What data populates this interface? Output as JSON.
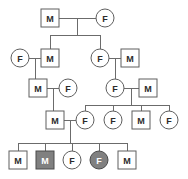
{
  "chart_data": {
    "type": "diagram",
    "title": "",
    "diagram_kind": "pedigree-chart",
    "generations": 5,
    "legend": {
      "square_means": "M",
      "circle_means": "F",
      "shaded_means": "affected",
      "unshaded_means": "unaffected"
    },
    "individuals": [
      {
        "id": "I-1",
        "generation": 1,
        "label": "M",
        "sex": "male",
        "shape": "square",
        "affected": false,
        "x": 50,
        "y": 18
      },
      {
        "id": "I-2",
        "generation": 1,
        "label": "F",
        "sex": "female",
        "shape": "circle",
        "affected": false,
        "x": 105,
        "y": 18
      },
      {
        "id": "II-1",
        "generation": 2,
        "label": "F",
        "sex": "female",
        "shape": "circle",
        "affected": false,
        "x": 20,
        "y": 58
      },
      {
        "id": "II-2",
        "generation": 2,
        "label": "M",
        "sex": "male",
        "shape": "square",
        "affected": false,
        "x": 50,
        "y": 58
      },
      {
        "id": "II-3",
        "generation": 2,
        "label": "F",
        "sex": "female",
        "shape": "circle",
        "affected": false,
        "x": 100,
        "y": 58
      },
      {
        "id": "II-4",
        "generation": 2,
        "label": "M",
        "sex": "male",
        "shape": "square",
        "affected": false,
        "x": 130,
        "y": 58
      },
      {
        "id": "III-1",
        "generation": 3,
        "label": "M",
        "sex": "male",
        "shape": "square",
        "affected": false,
        "x": 38,
        "y": 88
      },
      {
        "id": "III-2",
        "generation": 3,
        "label": "F",
        "sex": "female",
        "shape": "circle",
        "affected": false,
        "x": 68,
        "y": 88
      },
      {
        "id": "III-3",
        "generation": 3,
        "label": "F",
        "sex": "female",
        "shape": "circle",
        "affected": false,
        "x": 115,
        "y": 88
      },
      {
        "id": "III-4",
        "generation": 3,
        "label": "M",
        "sex": "male",
        "shape": "square",
        "affected": false,
        "x": 148,
        "y": 88
      },
      {
        "id": "IV-1",
        "generation": 4,
        "label": "M",
        "sex": "male",
        "shape": "square",
        "affected": false,
        "x": 55,
        "y": 120
      },
      {
        "id": "IV-2",
        "generation": 4,
        "label": "F",
        "sex": "female",
        "shape": "circle",
        "affected": false,
        "x": 85,
        "y": 120
      },
      {
        "id": "IV-3",
        "generation": 4,
        "label": "F",
        "sex": "female",
        "shape": "circle",
        "affected": false,
        "x": 113,
        "y": 120
      },
      {
        "id": "IV-4",
        "generation": 4,
        "label": "M",
        "sex": "male",
        "shape": "square",
        "affected": false,
        "x": 141,
        "y": 120
      },
      {
        "id": "IV-5",
        "generation": 4,
        "label": "F",
        "sex": "female",
        "shape": "circle",
        "affected": false,
        "x": 169,
        "y": 120
      },
      {
        "id": "V-1",
        "generation": 5,
        "label": "M",
        "sex": "male",
        "shape": "square",
        "affected": false,
        "x": 18,
        "y": 160
      },
      {
        "id": "V-2",
        "generation": 5,
        "label": "M",
        "sex": "male",
        "shape": "square",
        "affected": true,
        "x": 45,
        "y": 160
      },
      {
        "id": "V-3",
        "generation": 5,
        "label": "F",
        "sex": "female",
        "shape": "circle",
        "affected": false,
        "x": 72,
        "y": 160
      },
      {
        "id": "V-4",
        "generation": 5,
        "label": "F",
        "sex": "female",
        "shape": "circle",
        "affected": true,
        "x": 99,
        "y": 160
      },
      {
        "id": "V-5",
        "generation": 5,
        "label": "M",
        "sex": "male",
        "shape": "square",
        "affected": false,
        "x": 127,
        "y": 160
      }
    ],
    "matings": [
      {
        "partners": [
          "I-1",
          "I-2"
        ],
        "children": [
          "II-2",
          "II-3"
        ]
      },
      {
        "partners": [
          "II-1",
          "II-2"
        ],
        "children": [
          "III-1"
        ]
      },
      {
        "partners": [
          "II-3",
          "II-4"
        ],
        "children": [
          "III-3"
        ]
      },
      {
        "partners": [
          "III-1",
          "III-2"
        ],
        "children": [
          "IV-1"
        ]
      },
      {
        "partners": [
          "III-3",
          "III-4"
        ],
        "children": [
          "IV-2",
          "IV-3",
          "IV-4",
          "IV-5"
        ]
      },
      {
        "partners": [
          "IV-1",
          "IV-2"
        ],
        "children": [
          "V-1",
          "V-2",
          "V-3",
          "V-4",
          "V-5"
        ]
      }
    ],
    "affected_count": 2,
    "total_individuals": 20,
    "colors": {
      "background": "#ffffff",
      "line": "#6b6b6b",
      "symbol_stroke": "#5f5f5f",
      "unaffected_fill": "#ffffff",
      "affected_fill": "#808080",
      "unaffected_text": "#2b2b2b",
      "affected_text": "#ffffff"
    },
    "geometry": {
      "square_size": 18,
      "circle_radius": 9,
      "canvas_width": 188,
      "canvas_height": 179
    }
  },
  "connectors": [
    {
      "name": "mate-line-gen1",
      "x1": 59,
      "y1": 18,
      "x2": 96,
      "y2": 18
    },
    {
      "name": "sibdrop-gen1",
      "x1": 77,
      "y1": 18,
      "x2": 77,
      "y2": 35
    },
    {
      "name": "sibline-gen1",
      "x1": 50,
      "y1": 35,
      "x2": 100,
      "y2": 35
    },
    {
      "name": "childdrop-II-2",
      "x1": 50,
      "y1": 35,
      "x2": 50,
      "y2": 49
    },
    {
      "name": "childdrop-II-3",
      "x1": 100,
      "y1": 35,
      "x2": 100,
      "y2": 49
    },
    {
      "name": "mate-line-II-1-II-2",
      "x1": 29,
      "y1": 58,
      "x2": 41,
      "y2": 58
    },
    {
      "name": "sibdrop-II-couple",
      "x1": 35,
      "y1": 58,
      "x2": 35,
      "y2": 79
    },
    {
      "name": "sibline-II-couple",
      "x1": 35,
      "y1": 79,
      "x2": 38,
      "y2": 79
    },
    {
      "name": "childdrop-III-1",
      "x1": 38,
      "y1": 79,
      "x2": 38,
      "y2": 79
    },
    {
      "name": "mate-line-II-3-II-4",
      "x1": 109,
      "y1": 58,
      "x2": 121,
      "y2": 58
    },
    {
      "name": "sibdrop-II-couple-r",
      "x1": 115,
      "y1": 58,
      "x2": 115,
      "y2": 79
    },
    {
      "name": "mate-line-III-1-III-2",
      "x1": 47,
      "y1": 88,
      "x2": 59,
      "y2": 88
    },
    {
      "name": "sibdrop-III-couple",
      "x1": 53,
      "y1": 88,
      "x2": 53,
      "y2": 111
    },
    {
      "name": "sibline-III-couple",
      "x1": 53,
      "y1": 111,
      "x2": 55,
      "y2": 111
    },
    {
      "name": "mate-line-III-3-III-4",
      "x1": 124,
      "y1": 88,
      "x2": 139,
      "y2": 88
    },
    {
      "name": "sibdrop-III-couple-r",
      "x1": 131,
      "y1": 88,
      "x2": 131,
      "y2": 105
    },
    {
      "name": "sibline-gen4",
      "x1": 85,
      "y1": 105,
      "x2": 169,
      "y2": 105
    },
    {
      "name": "childdrop-IV-2",
      "x1": 85,
      "y1": 105,
      "x2": 85,
      "y2": 111
    },
    {
      "name": "childdrop-IV-3",
      "x1": 113,
      "y1": 105,
      "x2": 113,
      "y2": 111
    },
    {
      "name": "childdrop-IV-4",
      "x1": 141,
      "y1": 105,
      "x2": 141,
      "y2": 111
    },
    {
      "name": "childdrop-IV-5",
      "x1": 169,
      "y1": 105,
      "x2": 169,
      "y2": 111
    },
    {
      "name": "mate-line-IV-1-IV-2",
      "x1": 64,
      "y1": 120,
      "x2": 76,
      "y2": 120
    },
    {
      "name": "sibdrop-IV-couple",
      "x1": 70,
      "y1": 120,
      "x2": 70,
      "y2": 143
    },
    {
      "name": "sibline-gen5",
      "x1": 18,
      "y1": 143,
      "x2": 127,
      "y2": 143
    },
    {
      "name": "childdrop-V-1",
      "x1": 18,
      "y1": 143,
      "x2": 18,
      "y2": 151
    },
    {
      "name": "childdrop-V-2",
      "x1": 45,
      "y1": 143,
      "x2": 45,
      "y2": 151
    },
    {
      "name": "childdrop-V-3",
      "x1": 72,
      "y1": 143,
      "x2": 72,
      "y2": 151
    },
    {
      "name": "childdrop-V-4",
      "x1": 99,
      "y1": 143,
      "x2": 99,
      "y2": 151
    },
    {
      "name": "childdrop-V-5",
      "x1": 127,
      "y1": 143,
      "x2": 127,
      "y2": 151
    }
  ]
}
